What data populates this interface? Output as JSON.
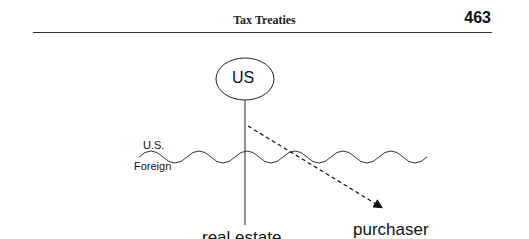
{
  "header": {
    "title": "Tax Treaties",
    "page_number": "463"
  },
  "diagram": {
    "node_label": "US",
    "region_upper": "U.S.",
    "region_lower": "Foreign",
    "left_node": "real estate",
    "right_node": "purchaser"
  }
}
